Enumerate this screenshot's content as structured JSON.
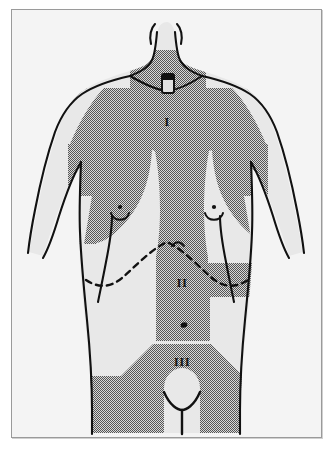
{
  "figure": {
    "kind": "anatomical-diagram",
    "background_color": "#f4f4f4",
    "frame_color": "#9a9a9a",
    "page_color": "#ffffff",
    "skin_color": "#e8e8e8",
    "shaded_zone_color": "#8c8c8c",
    "outline_color": "#111111",
    "width": 333,
    "height": 450
  },
  "zones": [
    {
      "id": "zone-1",
      "label": "I",
      "label_x": 166,
      "label_y": 122,
      "region": "upper chest and shoulders"
    },
    {
      "id": "zone-2",
      "label": "II",
      "label_x": 170,
      "label_y": 283,
      "region": "upper abdomen"
    },
    {
      "id": "zone-3",
      "label": "III",
      "label_x": 170,
      "label_y": 362,
      "region": "lower abdomen and groin"
    }
  ],
  "landmarks": [
    {
      "id": "sternal-notch-marker",
      "label": "",
      "x": 166,
      "y": 74
    },
    {
      "id": "nipple-left",
      "label": "",
      "x": 123,
      "y": 208
    },
    {
      "id": "nipple-right",
      "label": "",
      "x": 217,
      "y": 208
    },
    {
      "id": "umbilicus",
      "label": "",
      "x": 172,
      "y": 315
    },
    {
      "id": "costal-margin-dashed-line",
      "label": "",
      "x": 166,
      "y": 258
    },
    {
      "id": "genital-outline",
      "label": "",
      "x": 170,
      "y": 405
    }
  ]
}
